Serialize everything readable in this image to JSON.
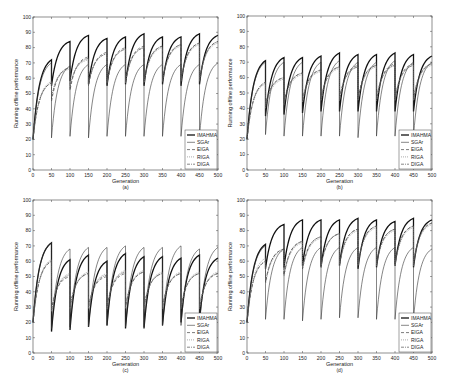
{
  "chart_data": [
    {
      "id": "a",
      "type": "line",
      "caption": "(a)",
      "xlabel": "Generation",
      "ylabel": "Running offline performance",
      "xlim": [
        0,
        500
      ],
      "ylim": [
        0,
        100
      ],
      "xticks": [
        0,
        50,
        100,
        150,
        200,
        250,
        300,
        350,
        400,
        450,
        500
      ],
      "yticks": [
        0,
        10,
        20,
        30,
        40,
        50,
        60,
        70,
        80,
        90,
        100
      ],
      "legend_position": "lower right",
      "period": 50,
      "series": [
        {
          "name": "IMAHMA",
          "style": "solid-thick",
          "starts": [
            20,
            55,
            58,
            56,
            55,
            56,
            55,
            56,
            55,
            56
          ],
          "peaks": [
            72,
            84,
            88,
            86,
            87,
            89,
            87,
            87,
            89,
            88
          ]
        },
        {
          "name": "SGAr",
          "style": "solid",
          "starts": [
            20,
            21,
            22,
            21,
            22,
            22,
            22,
            22,
            22,
            22
          ],
          "peaks": [
            70,
            68,
            69,
            69,
            69,
            69,
            69,
            69,
            69,
            70
          ]
        },
        {
          "name": "EIGA",
          "style": "dashed",
          "starts": [
            20,
            45,
            52,
            55,
            56,
            57,
            57,
            58,
            58,
            58
          ],
          "peaks": [
            57,
            67,
            74,
            77,
            80,
            81,
            81,
            82,
            83,
            84
          ]
        },
        {
          "name": "RIGA",
          "style": "dotted",
          "starts": [
            20,
            48,
            55,
            56,
            57,
            57,
            57,
            58,
            58,
            58
          ],
          "peaks": [
            58,
            66,
            72,
            76,
            79,
            80,
            80,
            81,
            82,
            83
          ]
        },
        {
          "name": "DIGA",
          "style": "dashdot",
          "starts": [
            20,
            47,
            54,
            56,
            57,
            58,
            58,
            58,
            58,
            58
          ],
          "peaks": [
            57,
            67,
            73,
            76,
            79,
            80,
            81,
            82,
            83,
            84
          ]
        }
      ]
    },
    {
      "id": "b",
      "type": "line",
      "caption": "(b)",
      "xlabel": "Generation",
      "ylabel": "Running offline performance",
      "xlim": [
        0,
        500
      ],
      "ylim": [
        0,
        100
      ],
      "xticks": [
        0,
        50,
        100,
        150,
        200,
        250,
        300,
        350,
        400,
        450,
        500
      ],
      "yticks": [
        0,
        10,
        20,
        30,
        40,
        50,
        60,
        70,
        80,
        90,
        100
      ],
      "legend_position": "lower right",
      "period": 50,
      "series": [
        {
          "name": "IMAHMA",
          "style": "solid-thick",
          "starts": [
            20,
            35,
            36,
            37,
            38,
            38,
            38,
            38,
            38,
            38
          ],
          "peaks": [
            71,
            73,
            73,
            74,
            76,
            75,
            75,
            76,
            75,
            74
          ]
        },
        {
          "name": "SGAr",
          "style": "solid",
          "starts": [
            20,
            23,
            22,
            22,
            22,
            22,
            21,
            22,
            22,
            22
          ],
          "peaks": [
            70,
            70,
            70,
            70,
            71,
            70,
            70,
            71,
            70,
            70
          ]
        },
        {
          "name": "EIGA",
          "style": "dashed",
          "starts": [
            20,
            42,
            44,
            45,
            46,
            46,
            46,
            46,
            46,
            46
          ],
          "peaks": [
            57,
            60,
            63,
            65,
            67,
            68,
            68,
            69,
            69,
            69
          ]
        },
        {
          "name": "RIGA",
          "style": "dotted",
          "starts": [
            20,
            40,
            42,
            44,
            45,
            45,
            45,
            45,
            45,
            45
          ],
          "peaks": [
            56,
            59,
            62,
            64,
            66,
            67,
            67,
            68,
            68,
            68
          ]
        },
        {
          "name": "DIGA",
          "style": "dashdot",
          "starts": [
            20,
            42,
            44,
            45,
            46,
            46,
            46,
            46,
            46,
            46
          ],
          "peaks": [
            57,
            60,
            63,
            65,
            67,
            67,
            68,
            68,
            68,
            69
          ]
        }
      ]
    },
    {
      "id": "c",
      "type": "line",
      "caption": "(c)",
      "xlabel": "Generation",
      "ylabel": "Running offline performance",
      "xlim": [
        0,
        500
      ],
      "ylim": [
        0,
        100
      ],
      "xticks": [
        0,
        50,
        100,
        150,
        200,
        250,
        300,
        350,
        400,
        450,
        500
      ],
      "yticks": [
        0,
        10,
        20,
        30,
        40,
        50,
        60,
        70,
        80,
        90,
        100
      ],
      "legend_position": "lower right",
      "period": 50,
      "series": [
        {
          "name": "IMAHMA",
          "style": "solid-thick",
          "starts": [
            20,
            14,
            15,
            17,
            18,
            16,
            16,
            18,
            20,
            22
          ],
          "peaks": [
            72,
            61,
            64,
            60,
            65,
            63,
            63,
            62,
            64,
            62
          ]
        },
        {
          "name": "SGAr",
          "style": "solid",
          "starts": [
            20,
            16,
            17,
            17,
            18,
            17,
            17,
            18,
            18,
            18
          ],
          "peaks": [
            72,
            68,
            69,
            69,
            70,
            69,
            69,
            70,
            68,
            69
          ]
        },
        {
          "name": "EIGA",
          "style": "dashed",
          "starts": [
            20,
            28,
            30,
            30,
            30,
            30,
            30,
            30,
            30,
            30
          ],
          "peaks": [
            60,
            50,
            52,
            50,
            52,
            53,
            52,
            52,
            52,
            52
          ]
        },
        {
          "name": "RIGA",
          "style": "dotted",
          "starts": [
            20,
            27,
            29,
            29,
            29,
            29,
            29,
            29,
            29,
            29
          ],
          "peaks": [
            61,
            52,
            53,
            52,
            54,
            54,
            53,
            53,
            53,
            53
          ]
        },
        {
          "name": "DIGA",
          "style": "dashdot",
          "starts": [
            20,
            28,
            30,
            30,
            30,
            30,
            30,
            30,
            30,
            30
          ],
          "peaks": [
            60,
            51,
            52,
            51,
            53,
            53,
            52,
            52,
            52,
            52
          ]
        }
      ]
    },
    {
      "id": "d",
      "type": "line",
      "caption": "(d)",
      "xlabel": "Generation",
      "ylabel": "Running offline performance",
      "xlim": [
        0,
        500
      ],
      "ylim": [
        0,
        100
      ],
      "xticks": [
        0,
        50,
        100,
        150,
        200,
        250,
        300,
        350,
        400,
        450,
        500
      ],
      "yticks": [
        0,
        10,
        20,
        30,
        40,
        50,
        60,
        70,
        80,
        90,
        100
      ],
      "legend_position": "lower right",
      "period": 50,
      "series": [
        {
          "name": "IMAHMA",
          "style": "solid-thick",
          "starts": [
            20,
            55,
            56,
            57,
            56,
            57,
            55,
            56,
            57,
            56
          ],
          "peaks": [
            71,
            84,
            87,
            87,
            87,
            88,
            87,
            86,
            88,
            87
          ]
        },
        {
          "name": "SGAr",
          "style": "solid",
          "starts": [
            20,
            22,
            22,
            21,
            22,
            23,
            23,
            22,
            22,
            22
          ],
          "peaks": [
            70,
            68,
            69,
            69,
            69,
            69,
            69,
            69,
            69,
            68
          ]
        },
        {
          "name": "EIGA",
          "style": "dashed",
          "starts": [
            20,
            46,
            51,
            55,
            57,
            58,
            58,
            58,
            58,
            58
          ],
          "peaks": [
            60,
            68,
            73,
            76,
            78,
            81,
            83,
            81,
            83,
            85
          ]
        },
        {
          "name": "RIGA",
          "style": "dotted",
          "starts": [
            20,
            45,
            50,
            54,
            56,
            57,
            57,
            57,
            57,
            57
          ],
          "peaks": [
            62,
            67,
            72,
            75,
            78,
            80,
            82,
            80,
            82,
            84
          ]
        },
        {
          "name": "DIGA",
          "style": "dashdot",
          "starts": [
            20,
            46,
            51,
            55,
            57,
            58,
            58,
            58,
            58,
            58
          ],
          "peaks": [
            60,
            68,
            73,
            76,
            78,
            81,
            83,
            81,
            83,
            85
          ]
        }
      ]
    }
  ],
  "layout": {
    "panels": [
      {
        "left": 33,
        "top": 17,
        "right": 218,
        "bottom": 170
      },
      {
        "left": 247,
        "top": 16,
        "right": 432,
        "bottom": 170
      },
      {
        "left": 33,
        "top": 200,
        "right": 218,
        "bottom": 353
      },
      {
        "left": 247,
        "top": 200,
        "right": 432,
        "bottom": 353
      }
    ]
  }
}
